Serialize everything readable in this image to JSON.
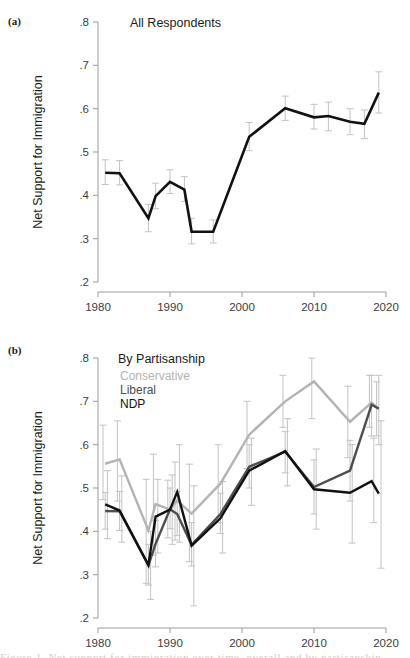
{
  "figure": {
    "width": 410,
    "height": 658,
    "background": "#ffffff",
    "caption_sliver": "Figure 1. Net support for immigration over time, overall and by partisanship."
  },
  "colors": {
    "conservative": "#b3b3b3",
    "liberal": "#4d4d4d",
    "ndp": "#111111",
    "all": "#111111",
    "errorbar": "#c2c2c2",
    "axis": "#9a9a9a",
    "text": "#1a1a1a"
  },
  "panels": [
    {
      "tag": "(a)",
      "title": "All Respondents",
      "ylabel": "Net Support for Immigration",
      "legend": []
    },
    {
      "tag": "(b)",
      "title": "By Partisanship",
      "ylabel": "Net Support for Immigration",
      "legend": [
        {
          "label": "Conservative",
          "color": "#b3b3b3"
        },
        {
          "label": "Liberal",
          "color": "#4d4d4d"
        },
        {
          "label": "NDP",
          "color": "#111111"
        }
      ]
    }
  ],
  "axes": {
    "xlabel": "",
    "ylabel": "Net Support for Immigration",
    "xlim": [
      1980,
      2020
    ],
    "ylim": [
      0.2,
      0.8
    ],
    "xticks": [
      1980,
      1990,
      2000,
      2010,
      2020
    ],
    "xtick_labels": [
      "1980",
      "1990",
      "2000",
      "2010",
      "2020"
    ],
    "yticks": [
      0.2,
      0.3,
      0.4,
      0.5,
      0.6,
      0.7,
      0.8
    ],
    "ytick_labels": [
      ".2",
      ".3",
      ".4",
      ".5",
      ".6",
      ".7",
      ".8"
    ],
    "grid": false
  },
  "chart_data": [
    {
      "type": "line",
      "title": "All Respondents",
      "panel": "(a)",
      "xlabel": "",
      "ylabel": "Net Support for Immigration",
      "xlim": [
        1980,
        2020
      ],
      "ylim": [
        0.2,
        0.8
      ],
      "grid": false,
      "legend_position": "none",
      "x": [
        1981,
        1983,
        1987,
        1988,
        1990,
        1992,
        1993,
        1996,
        2001,
        2006,
        2010,
        2012,
        2015,
        2017,
        2019
      ],
      "series": [
        {
          "name": "All Respondents",
          "color": "#111111",
          "values": [
            0.452,
            0.451,
            0.347,
            0.398,
            0.431,
            0.413,
            0.316,
            0.316,
            0.535,
            0.601,
            0.58,
            0.583,
            0.57,
            0.565,
            0.637
          ],
          "err_low": [
            0.425,
            0.424,
            0.316,
            0.369,
            0.404,
            0.386,
            0.288,
            0.29,
            0.503,
            0.573,
            0.553,
            0.549,
            0.54,
            0.531,
            0.59
          ],
          "err_high": [
            0.482,
            0.48,
            0.379,
            0.428,
            0.459,
            0.443,
            0.347,
            0.343,
            0.568,
            0.629,
            0.61,
            0.615,
            0.6,
            0.597,
            0.685
          ]
        }
      ]
    },
    {
      "type": "line",
      "title": "By Partisanship",
      "panel": "(b)",
      "xlabel": "",
      "ylabel": "Net Support for Immigration",
      "xlim": [
        1980,
        2020
      ],
      "ylim": [
        0.2,
        0.8
      ],
      "grid": false,
      "legend_position": "top-left",
      "x": [
        1981,
        1983,
        1987,
        1988,
        1990,
        1991,
        1993,
        1997,
        2001,
        2006,
        2010,
        2015,
        2018,
        2019
      ],
      "series": [
        {
          "name": "Conservative",
          "color": "#b3b3b3",
          "values": [
            0.556,
            0.566,
            0.402,
            0.463,
            0.45,
            0.471,
            0.441,
            0.51,
            0.623,
            0.7,
            0.746,
            0.653,
            0.697,
            0.683
          ],
          "err_low": [
            0.473,
            0.47,
            0.28,
            0.345,
            0.385,
            0.38,
            0.33,
            0.42,
            0.545,
            0.64,
            0.66,
            0.57,
            0.64,
            0.62
          ],
          "err_high": [
            0.645,
            0.655,
            0.52,
            0.578,
            0.518,
            0.56,
            0.555,
            0.6,
            0.7,
            0.76,
            0.83,
            0.735,
            0.76,
            0.745
          ]
        },
        {
          "name": "Liberal",
          "color": "#4d4d4d",
          "values": [
            0.447,
            0.446,
            0.322,
            0.371,
            0.451,
            0.44,
            0.369,
            0.44,
            0.549,
            0.584,
            0.502,
            0.54,
            0.692,
            0.683
          ],
          "err_low": [
            0.405,
            0.402,
            0.276,
            0.318,
            0.406,
            0.39,
            0.32,
            0.395,
            0.5,
            0.535,
            0.44,
            0.47,
            0.62,
            0.6
          ],
          "err_high": [
            0.49,
            0.492,
            0.37,
            0.425,
            0.5,
            0.492,
            0.42,
            0.488,
            0.6,
            0.63,
            0.565,
            0.61,
            0.76,
            0.76
          ]
        },
        {
          "name": "NDP",
          "color": "#111111",
          "values": [
            0.462,
            0.448,
            0.322,
            0.434,
            0.45,
            0.491,
            0.367,
            0.43,
            0.54,
            0.585,
            0.497,
            0.489,
            0.516,
            0.487
          ],
          "err_low": [
            0.383,
            0.375,
            0.243,
            0.35,
            0.37,
            0.375,
            0.228,
            0.35,
            0.46,
            0.505,
            0.405,
            0.373,
            0.42,
            0.315
          ],
          "err_high": [
            0.54,
            0.528,
            0.4,
            0.52,
            0.53,
            0.6,
            0.505,
            0.515,
            0.615,
            0.66,
            0.59,
            0.6,
            0.615,
            0.655
          ]
        }
      ]
    }
  ]
}
